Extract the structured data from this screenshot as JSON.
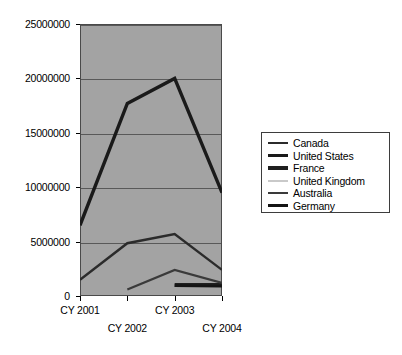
{
  "chart_data": {
    "type": "line",
    "title": "",
    "xlabel": "",
    "ylabel": "",
    "categories": [
      "CY 2001",
      "CY 2002",
      "CY 2003",
      "CY 2004"
    ],
    "ylim": [
      0,
      25000000
    ],
    "y_ticks": [
      0,
      5000000,
      10000000,
      15000000,
      20000000,
      25000000
    ],
    "y_tick_labels": [
      "0",
      "5000000",
      "10000000",
      "15000000",
      "20000000",
      "25000000"
    ],
    "grid": true,
    "legend_position": "right",
    "plot_background": "#a3a3a3",
    "series": [
      {
        "name": "Canada",
        "color": "#2b2b2b",
        "width": 2.4,
        "values": [
          1500000,
          4850000,
          5700000,
          2400000
        ]
      },
      {
        "name": "United States",
        "color": "#1a1a1a",
        "width": 3.4,
        "values": [
          6500000,
          17700000,
          20000000,
          9500000
        ]
      },
      {
        "name": "France",
        "color": "#1f1f1f",
        "width": 4.0,
        "values": [
          null,
          null,
          1000000,
          1000000
        ]
      },
      {
        "name": "United Kingdom",
        "color": "#c9c9c9",
        "width": 2.0,
        "values": [
          null,
          null,
          null,
          null
        ]
      },
      {
        "name": "Australia",
        "color": "#3a3a3a",
        "width": 2.2,
        "values": [
          null,
          600000,
          2400000,
          1200000
        ]
      },
      {
        "name": "Germany",
        "color": "#141414",
        "width": 2.8,
        "values": [
          null,
          null,
          950000,
          900000
        ]
      }
    ]
  },
  "legend": {
    "items": [
      {
        "label": "Canada"
      },
      {
        "label": "United States"
      },
      {
        "label": "France"
      },
      {
        "label": "United Kingdom"
      },
      {
        "label": "Australia"
      },
      {
        "label": "Germany"
      }
    ]
  }
}
